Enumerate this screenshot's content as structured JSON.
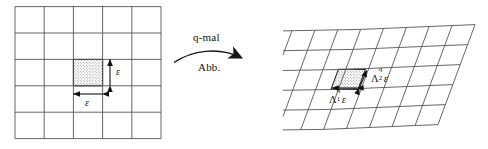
{
  "figure": {
    "background_color": "#ffffff",
    "line_color": "#55555a",
    "ink_color": "#111111",
    "shade_color": "#cfcfcf"
  },
  "left_panel": {
    "name": "square-grid",
    "rows": 5,
    "columns": 5,
    "highlighted_cell": {
      "row": 3,
      "column": 3,
      "fill": "stipple"
    },
    "labels": {
      "height_label": "ε",
      "width_label": "ε"
    }
  },
  "map_arrow": {
    "label_above": "q-mal",
    "label_below": "Abb.",
    "direction": "left-to-right"
  },
  "right_panel": {
    "name": "parallelogram-grid",
    "rows": 5,
    "columns": 5,
    "highlighted_cell": {
      "row": 3,
      "column": 3,
      "fill": "stipple"
    },
    "labels": {
      "side1": {
        "base": "Λ",
        "sup": "q",
        "sub": "1",
        "factor": "ε"
      },
      "side2": {
        "base": "Λ",
        "sup": "q",
        "sub": "2",
        "factor": "ε"
      },
      "side1_text": "Λ₁ᵠε",
      "side2_text": "Λ₂ᵠε"
    }
  }
}
